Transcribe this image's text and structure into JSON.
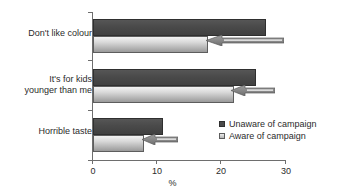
{
  "chart_data": {
    "type": "bar",
    "orientation": "horizontal",
    "title": "",
    "subtitle": "",
    "xlabel": "%",
    "ylabel": "",
    "xlim": [
      0,
      30
    ],
    "xticks": [
      0,
      10,
      20,
      30
    ],
    "xtick_labels": [
      "0",
      "10",
      "20",
      "30"
    ],
    "grid": false,
    "legend_position": "inside-right-lower",
    "categories": [
      "Don't like colour",
      "It's for kids\nyounger than me",
      "Horrible taste"
    ],
    "series": [
      {
        "name": "Unaware of campaign",
        "color": "#4a4a4a",
        "values": [
          27,
          25.5,
          11
        ]
      },
      {
        "name": "Aware of campaign",
        "color": "#d9d9d9",
        "values": [
          18,
          22,
          8
        ]
      }
    ],
    "annotations": [
      {
        "type": "arrow",
        "direction": "left",
        "points_to_series": "Aware of campaign",
        "points_to_category": "Don't like colour"
      },
      {
        "type": "arrow",
        "direction": "left",
        "points_to_series": "Aware of campaign",
        "points_to_category": "It's for kids younger than me"
      },
      {
        "type": "arrow",
        "direction": "left",
        "points_to_series": "Aware of campaign",
        "points_to_category": "Horrible taste"
      }
    ]
  },
  "legend": {
    "items": [
      {
        "label": "Unaware of campaign"
      },
      {
        "label": "Aware of campaign"
      }
    ]
  },
  "axis": {
    "x_title": "%",
    "tick_labels": [
      "0",
      "10",
      "20",
      "30"
    ]
  }
}
